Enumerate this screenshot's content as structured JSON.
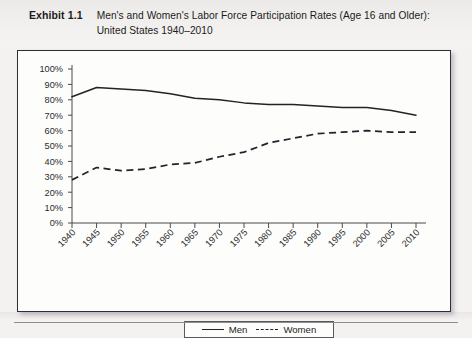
{
  "header": {
    "exhibit_label": "Exhibit 1.1",
    "title": "Men's and Women's Labor Force Participation Rates (Age 16 and Older): United States 1940–2010"
  },
  "legend": {
    "men_label": "Men",
    "women_label": "Women"
  },
  "colors": {
    "men_line": "#232323",
    "women_line": "#23232e",
    "axis": "#4a4a4a",
    "frame": "#2e2e34",
    "page_background": "#f3f2f0",
    "figure_background": "#fdfdfc"
  },
  "chart_data": {
    "type": "line",
    "title": "Men's and Women's Labor Force Participation Rates (Age 16 and Older): United States 1940–2010",
    "xlabel": "",
    "ylabel": "",
    "x": [
      1940,
      1945,
      1950,
      1955,
      1960,
      1965,
      1970,
      1975,
      1980,
      1985,
      1990,
      1995,
      2000,
      2005,
      2010
    ],
    "categories": [
      "1940",
      "1945",
      "1950",
      "1955",
      "1960",
      "1965",
      "1970",
      "1975",
      "1980",
      "1985",
      "1990",
      "1995",
      "2000",
      "2005",
      "2010"
    ],
    "series": [
      {
        "name": "Men",
        "style": "solid",
        "values": [
          82,
          88,
          87,
          86,
          84,
          81,
          80,
          78,
          77,
          77,
          76,
          75,
          75,
          73,
          70
        ]
      },
      {
        "name": "Women",
        "style": "dashed",
        "values": [
          28,
          36,
          34,
          35,
          38,
          39,
          43,
          46,
          52,
          55,
          58,
          59,
          60,
          59,
          59
        ]
      }
    ],
    "ylim": [
      0,
      100
    ],
    "ytick_labels": [
      "0%",
      "10%",
      "20%",
      "30%",
      "40%",
      "50%",
      "60%",
      "70%",
      "80%",
      "90%",
      "100%"
    ],
    "yticks": [
      0,
      10,
      20,
      30,
      40,
      50,
      60,
      70,
      80,
      90,
      100
    ],
    "grid": false,
    "legend_position": "bottom-center"
  }
}
